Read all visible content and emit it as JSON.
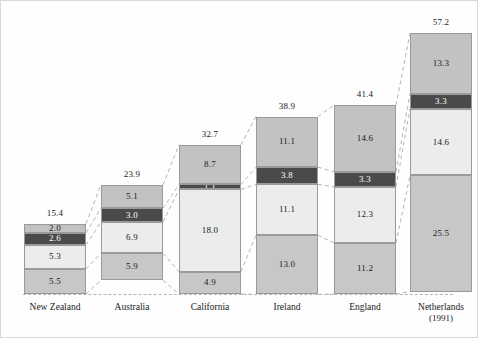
{
  "chart_data": {
    "type": "bar",
    "subtype": "stacked-bar-with-connectors",
    "title": "",
    "subtitle": "",
    "xlabel": "",
    "ylabel": "",
    "ylim": [
      0,
      62
    ],
    "grid": false,
    "legend": null,
    "categories": [
      "New Zealand",
      "Australia",
      "California",
      "Ireland",
      "England",
      "Netherlands"
    ],
    "category_sublabels": [
      "",
      "",
      "",
      "",
      "",
      "(1991)"
    ],
    "stack_order_bottom_to_top": [
      "segment-1",
      "segment-2",
      "segment-3",
      "segment-4"
    ],
    "series": [
      {
        "name": "segment-1",
        "color": "#c7c7c7",
        "values": [
          5.5,
          5.9,
          4.9,
          13.0,
          11.2,
          25.5
        ]
      },
      {
        "name": "segment-2",
        "color": "#ececec",
        "values": [
          5.3,
          6.9,
          18.0,
          11.1,
          12.3,
          14.6
        ]
      },
      {
        "name": "segment-3",
        "color": "#4a4a4a",
        "values": [
          2.6,
          3.0,
          1.1,
          3.8,
          3.3,
          3.3
        ]
      },
      {
        "name": "segment-4",
        "color": "#c2c2c2",
        "values": [
          2.0,
          5.1,
          8.7,
          11.1,
          14.6,
          13.3
        ]
      }
    ],
    "totals": [
      15.4,
      23.9,
      32.7,
      38.9,
      41.4,
      57.2
    ],
    "bars": [
      {
        "category": "New Zealand",
        "sublabel": "",
        "total": "15.4",
        "segments": [
          {
            "name": "segment-4",
            "value": "2.0",
            "shade": "mid"
          },
          {
            "name": "segment-3",
            "value": "2.6",
            "shade": "dark"
          },
          {
            "name": "segment-2",
            "value": "5.3",
            "shade": "light"
          },
          {
            "name": "segment-1",
            "value": "5.5",
            "shade": "midlight"
          }
        ]
      },
      {
        "category": "Australia",
        "sublabel": "",
        "total": "23.9",
        "segments": [
          {
            "name": "segment-4",
            "value": "5.1",
            "shade": "mid"
          },
          {
            "name": "segment-3",
            "value": "3.0",
            "shade": "dark"
          },
          {
            "name": "segment-2",
            "value": "6.9",
            "shade": "light"
          },
          {
            "name": "segment-1",
            "value": "5.9",
            "shade": "midlight"
          }
        ]
      },
      {
        "category": "California",
        "sublabel": "",
        "total": "32.7",
        "segments": [
          {
            "name": "segment-4",
            "value": "8.7",
            "shade": "mid"
          },
          {
            "name": "segment-3",
            "value": "1.1",
            "shade": "dark"
          },
          {
            "name": "segment-2",
            "value": "18.0",
            "shade": "light"
          },
          {
            "name": "segment-1",
            "value": "4.9",
            "shade": "midlight"
          }
        ]
      },
      {
        "category": "Ireland",
        "sublabel": "",
        "total": "38.9",
        "segments": [
          {
            "name": "segment-4",
            "value": "11.1",
            "shade": "mid"
          },
          {
            "name": "segment-3",
            "value": "3.8",
            "shade": "dark"
          },
          {
            "name": "segment-2",
            "value": "11.1",
            "shade": "light"
          },
          {
            "name": "segment-1",
            "value": "13.0",
            "shade": "midlight"
          }
        ]
      },
      {
        "category": "England",
        "sublabel": "",
        "total": "41.4",
        "segments": [
          {
            "name": "segment-4",
            "value": "14.6",
            "shade": "mid"
          },
          {
            "name": "segment-3",
            "value": "3.3",
            "shade": "dark"
          },
          {
            "name": "segment-2",
            "value": "12.3",
            "shade": "light"
          },
          {
            "name": "segment-1",
            "value": "11.2",
            "shade": "midlight"
          }
        ]
      },
      {
        "category": "Netherlands",
        "sublabel": "(1991)",
        "total": "57.2",
        "segments": [
          {
            "name": "segment-4",
            "value": "13.3",
            "shade": "mid"
          },
          {
            "name": "segment-3",
            "value": "3.3",
            "shade": "dark"
          },
          {
            "name": "segment-2",
            "value": "14.6",
            "shade": "light"
          },
          {
            "name": "segment-1",
            "value": "25.5",
            "shade": "midlight"
          }
        ]
      }
    ],
    "colors": {
      "mid": "#c2c2c2",
      "dark": "#4a4a4a",
      "light": "#ececec",
      "midlight": "#c7c7c7",
      "segment_border": "#9a9a9a",
      "connector": "#b4b4b4",
      "text": "#1a1a1a",
      "dark_text": "#ffffff",
      "background": "#fefefe"
    }
  }
}
